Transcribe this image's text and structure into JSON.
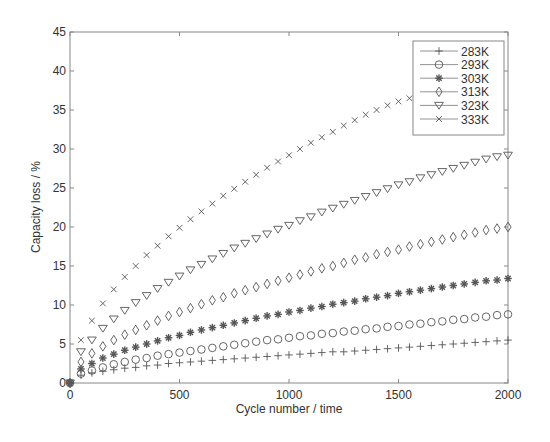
{
  "chart_data": {
    "type": "scatter",
    "title": "",
    "xlabel": "Cycle number / time",
    "ylabel": "Capacity loss / %",
    "xlim": [
      0,
      2000
    ],
    "ylim": [
      0,
      45
    ],
    "xticks": [
      0,
      500,
      1000,
      1500,
      2000
    ],
    "yticks": [
      0,
      5,
      10,
      15,
      20,
      25,
      30,
      35,
      40,
      45
    ],
    "grid": false,
    "legend_position": "upper right",
    "x": [
      0,
      50,
      100,
      150,
      200,
      250,
      300,
      350,
      400,
      450,
      500,
      550,
      600,
      650,
      700,
      750,
      800,
      850,
      900,
      950,
      1000,
      1050,
      1100,
      1150,
      1200,
      1250,
      1300,
      1350,
      1400,
      1450,
      1500,
      1550,
      1600,
      1650,
      1700,
      1750,
      1800,
      1850,
      1900,
      1950,
      2000
    ],
    "series": [
      {
        "name": "283K",
        "marker": "plus",
        "values": [
          0,
          1.0,
          1.3,
          1.5,
          1.7,
          1.9,
          2.0,
          2.2,
          2.3,
          2.5,
          2.6,
          2.7,
          2.8,
          2.9,
          3.0,
          3.1,
          3.2,
          3.3,
          3.4,
          3.5,
          3.6,
          3.7,
          3.8,
          3.9,
          4.0,
          4.0,
          4.1,
          4.2,
          4.3,
          4.4,
          4.5,
          4.6,
          4.7,
          4.8,
          4.9,
          5.0,
          5.1,
          5.2,
          5.3,
          5.4,
          5.5
        ]
      },
      {
        "name": "293K",
        "marker": "circle",
        "values": [
          0,
          1.2,
          1.6,
          2.0,
          2.4,
          2.7,
          3.0,
          3.2,
          3.5,
          3.7,
          3.9,
          4.1,
          4.3,
          4.5,
          4.7,
          4.9,
          5.1,
          5.3,
          5.5,
          5.6,
          5.8,
          6.0,
          6.1,
          6.3,
          6.4,
          6.6,
          6.7,
          6.9,
          7.0,
          7.2,
          7.3,
          7.5,
          7.6,
          7.8,
          7.9,
          8.1,
          8.2,
          8.4,
          8.5,
          8.7,
          8.8
        ]
      },
      {
        "name": "303K",
        "marker": "asterisk",
        "values": [
          0,
          1.8,
          2.5,
          3.2,
          3.7,
          4.2,
          4.6,
          5.0,
          5.4,
          5.8,
          6.1,
          6.5,
          6.8,
          7.1,
          7.4,
          7.7,
          8.0,
          8.3,
          8.6,
          8.8,
          9.1,
          9.3,
          9.6,
          9.8,
          10.1,
          10.3,
          10.5,
          10.8,
          11.0,
          11.2,
          11.5,
          11.7,
          11.9,
          12.1,
          12.3,
          12.5,
          12.7,
          12.9,
          13.1,
          13.2,
          13.4
        ]
      },
      {
        "name": "313K",
        "marker": "diamond",
        "values": [
          0,
          2.7,
          3.8,
          4.7,
          5.5,
          6.2,
          6.8,
          7.4,
          8.0,
          8.6,
          9.1,
          9.6,
          10.1,
          10.6,
          11.0,
          11.5,
          11.9,
          12.3,
          12.7,
          13.1,
          13.5,
          13.9,
          14.3,
          14.7,
          15.0,
          15.4,
          15.8,
          16.1,
          16.5,
          16.8,
          17.1,
          17.5,
          17.8,
          18.1,
          18.4,
          18.7,
          19.0,
          19.3,
          19.6,
          19.8,
          20.0
        ]
      },
      {
        "name": "323K",
        "marker": "triangle-down",
        "values": [
          0,
          4.0,
          5.5,
          7.0,
          8.2,
          9.3,
          10.3,
          11.2,
          12.1,
          12.9,
          13.7,
          14.5,
          15.2,
          15.9,
          16.6,
          17.3,
          17.9,
          18.5,
          19.1,
          19.7,
          20.2,
          20.8,
          21.3,
          21.9,
          22.4,
          22.9,
          23.4,
          23.9,
          24.4,
          24.9,
          25.4,
          25.8,
          26.3,
          26.7,
          27.1,
          27.5,
          27.9,
          28.3,
          28.7,
          29.0,
          29.2
        ]
      },
      {
        "name": "333K",
        "marker": "x",
        "values": [
          0,
          5.5,
          8.0,
          10.2,
          12.0,
          13.6,
          15.0,
          16.4,
          17.6,
          18.8,
          19.9,
          21.0,
          22.0,
          23.0,
          24.0,
          24.9,
          25.8,
          26.7,
          27.6,
          28.4,
          29.2,
          30.0,
          30.8,
          31.5,
          32.2,
          33.0,
          33.7,
          34.4,
          35.0,
          35.6,
          36.1,
          36.5,
          null,
          null,
          null,
          null,
          null,
          null,
          null,
          null,
          null
        ]
      }
    ]
  },
  "axes": {
    "xlabel": "Cycle number / time",
    "ylabel": "Capacity loss / %",
    "xtick_labels": [
      "0",
      "500",
      "1000",
      "1500",
      "2000"
    ],
    "ytick_labels": [
      "0",
      "5",
      "10",
      "15",
      "20",
      "25",
      "30",
      "35",
      "40",
      "45"
    ]
  },
  "legend": {
    "entries": [
      "283K",
      "293K",
      "303K",
      "313K",
      "323K",
      "333K"
    ]
  },
  "colors": {
    "marker": "#555555",
    "axis": "#777777",
    "text": "#333333"
  }
}
